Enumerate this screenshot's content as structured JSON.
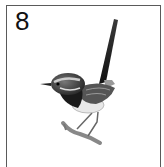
{
  "card": {
    "number": "8",
    "image": {
      "subject": "bird-illustration",
      "description": "Pencil sketch of a fairy-wren perched on a twig with upright tail"
    },
    "colors": {
      "border": "#5a5a5a",
      "background": "#ffffff",
      "text": "#111111"
    }
  }
}
